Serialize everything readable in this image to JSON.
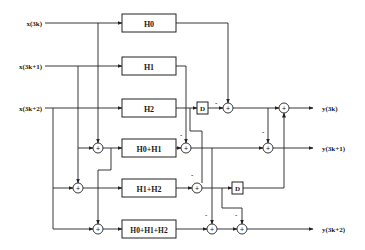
{
  "diagram": {
    "type": "block-diagram",
    "inputs": [
      {
        "label": "x(3k)"
      },
      {
        "label": "x(3k+1)"
      },
      {
        "label": "x(3k+2)"
      }
    ],
    "filters": [
      {
        "label": "H0"
      },
      {
        "label": "H1"
      },
      {
        "label": "H2"
      },
      {
        "label": "H0+H1"
      },
      {
        "label": "H1+H2"
      },
      {
        "label": "H0+H1+H2"
      }
    ],
    "delays": [
      {
        "label": "D"
      },
      {
        "label": "D"
      }
    ],
    "adder_symbol": "+",
    "minus_sign": "-",
    "outputs": [
      {
        "label": "y(3k)"
      },
      {
        "label": "y(3k+1)"
      },
      {
        "label": "y(3k+2)"
      }
    ]
  }
}
